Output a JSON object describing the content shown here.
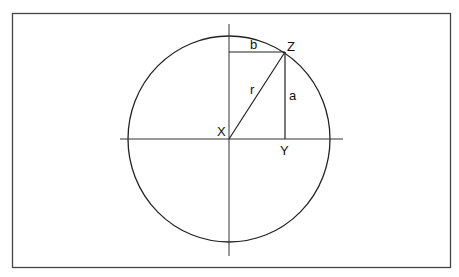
{
  "diagram": {
    "labels": {
      "origin": "X",
      "point_on_circle": "Z",
      "foot": "Y",
      "radius": "r",
      "vertical_leg": "a",
      "horizontal_leg": "b"
    },
    "colors": {
      "stroke": "#222222",
      "frame": "#444444",
      "background": "#ffffff"
    }
  }
}
